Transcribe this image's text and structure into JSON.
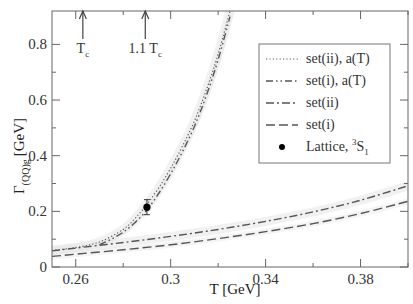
{
  "chart_data": {
    "type": "line",
    "title": "",
    "xlabel": "T [GeV]",
    "ylabel": "Γ_(QQ̄)g [GeV]",
    "ylabel_main": "Γ",
    "ylabel_sub": "(QQ)g",
    "ylabel_unit": "[GeV]",
    "xlim": [
      0.25,
      0.4
    ],
    "ylim": [
      0,
      0.92
    ],
    "xticks": [
      0.26,
      0.3,
      0.34,
      0.38
    ],
    "xtick_labels": [
      "0.26",
      "0.3",
      "0.34",
      "0.38"
    ],
    "xminor": [
      0.28,
      0.32,
      0.36,
      0.4
    ],
    "yticks": [
      0,
      0.2,
      0.4,
      0.6,
      0.8
    ],
    "ytick_labels": [
      "0",
      "0.2",
      "0.4",
      "0.6",
      "0.8"
    ],
    "yminor": [
      0.1,
      0.3,
      0.5,
      0.7
    ],
    "grid": false,
    "legend_position": "upper right",
    "annotations": [
      {
        "text": "T",
        "sub": "c",
        "x": 0.263,
        "kind": "arrow"
      },
      {
        "text": "1.1 T",
        "sub": "c",
        "x": 0.2893,
        "kind": "arrow"
      }
    ],
    "series": [
      {
        "name": "set(ii), a(T)",
        "style": "dotted",
        "x": [
          0.25,
          0.26,
          0.27,
          0.28,
          0.285,
          0.29,
          0.295,
          0.3,
          0.305,
          0.31,
          0.315,
          0.32,
          0.325
        ],
        "values": [
          0.06,
          0.07,
          0.09,
          0.135,
          0.175,
          0.225,
          0.285,
          0.355,
          0.435,
          0.525,
          0.635,
          0.765,
          0.92
        ]
      },
      {
        "name": "set(i), a(T)",
        "style": "dash-dot-dot",
        "x": [
          0.27,
          0.275,
          0.28,
          0.285,
          0.29,
          0.295,
          0.3,
          0.305,
          0.31,
          0.315,
          0.32,
          0.325
        ],
        "values": [
          0.08,
          0.1,
          0.125,
          0.16,
          0.205,
          0.265,
          0.335,
          0.415,
          0.505,
          0.615,
          0.745,
          0.9
        ]
      },
      {
        "name": "set(ii)",
        "style": "dash-dot",
        "x": [
          0.25,
          0.26,
          0.28,
          0.3,
          0.32,
          0.34,
          0.36,
          0.38,
          0.4
        ],
        "values": [
          0.058,
          0.068,
          0.088,
          0.11,
          0.135,
          0.164,
          0.198,
          0.24,
          0.292
        ]
      },
      {
        "name": "set(i)",
        "style": "dashed",
        "x": [
          0.25,
          0.26,
          0.28,
          0.3,
          0.32,
          0.34,
          0.36,
          0.38,
          0.4
        ],
        "values": [
          0.038,
          0.046,
          0.062,
          0.08,
          0.102,
          0.127,
          0.156,
          0.192,
          0.236
        ]
      },
      {
        "name": "Lattice, ³S₁",
        "style": "point",
        "x": [
          0.29
        ],
        "values": [
          0.215
        ],
        "yerr": [
          0.027
        ]
      }
    ]
  },
  "legend": {
    "items": [
      {
        "label": "set(ii), a(T)"
      },
      {
        "label": "set(i), a(T)"
      },
      {
        "label": "set(ii)"
      },
      {
        "label": "set(i)"
      },
      {
        "label": "Lattice, ",
        "sup": "3",
        "main": "S",
        "sub": "1"
      }
    ]
  },
  "colors": {
    "axis": "#555555",
    "curve": "#555555",
    "band": "#e6e6e6",
    "point": "#000000"
  }
}
